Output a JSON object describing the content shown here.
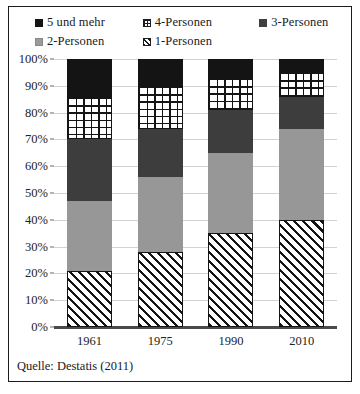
{
  "legend": {
    "rows": [
      [
        {
          "label": "5 und mehr",
          "swatch": "black-square-icon"
        },
        {
          "label": "4-Personen",
          "swatch": "grid-pattern-icon"
        },
        {
          "label": "3-Personen",
          "swatch": "dark-gray-square-icon"
        }
      ],
      [
        {
          "label": "2-Personen",
          "swatch": "mid-gray-square-icon"
        },
        {
          "label": "1-Personen",
          "swatch": "diagonal-hatch-icon"
        }
      ]
    ]
  },
  "source": {
    "text": "Quelle: Destatis (2011)"
  },
  "colors": {
    "five_plus": "#141414",
    "three": "#3d3d3d",
    "two": "#979797",
    "four_pattern": "#ffffff",
    "one_pattern": "#ffffff",
    "gridline": "#d2d2d2",
    "axis": "#4a4a4a",
    "frame": "#1c1c1c"
  },
  "chart_data": {
    "type": "bar",
    "title": "",
    "subtitle": "",
    "xlabel": "",
    "ylabel": "",
    "stacked": true,
    "stack_mode": "percent",
    "grid": true,
    "legend_position": "top",
    "ylim": [
      0,
      100
    ],
    "ytick_labels": [
      "0%",
      "10%",
      "20%",
      "30%",
      "40%",
      "50%",
      "60%",
      "70%",
      "80%",
      "90%",
      "100%"
    ],
    "ytick_values": [
      0,
      10,
      20,
      30,
      40,
      50,
      60,
      70,
      80,
      90,
      100
    ],
    "categories": [
      "1961",
      "1975",
      "1990",
      "2010"
    ],
    "series": [
      {
        "name": "1-Personen",
        "values": [
          21,
          28,
          35,
          40
        ]
      },
      {
        "name": "2-Personen",
        "values": [
          26,
          28,
          30,
          34
        ]
      },
      {
        "name": "3-Personen",
        "values": [
          23,
          18,
          16,
          12
        ]
      },
      {
        "name": "4-Personen",
        "values": [
          16,
          16,
          12,
          9
        ]
      },
      {
        "name": "5 und mehr",
        "values": [
          14,
          10,
          7,
          5
        ]
      }
    ],
    "cumulative_tops": {
      "1961": [
        21,
        47,
        70,
        86,
        100
      ],
      "1975": [
        28,
        56,
        74,
        90,
        100
      ],
      "1990": [
        35,
        65,
        81,
        93,
        100
      ],
      "2010": [
        40,
        74,
        86,
        95,
        100
      ]
    }
  }
}
